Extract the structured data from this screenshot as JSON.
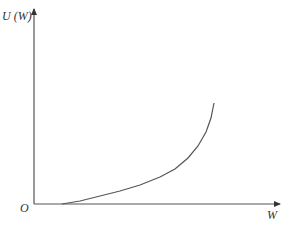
{
  "chart_data": {
    "type": "line",
    "title": "",
    "xlabel": "W",
    "ylabel": "U (W)",
    "origin_label": "O",
    "grid": false,
    "legend": null,
    "x_ticks": [],
    "y_ticks": [],
    "series": [
      {
        "name": "U(W)",
        "description": "Convex, increasing curve starting above origin on the W-axis and rising steeply toward the upper right",
        "points_px": [
          [
            62,
            204
          ],
          [
            80,
            201
          ],
          [
            100,
            196
          ],
          [
            120,
            191
          ],
          [
            140,
            185
          ],
          [
            160,
            177
          ],
          [
            175,
            169
          ],
          [
            188,
            158
          ],
          [
            198,
            146
          ],
          [
            206,
            132
          ],
          [
            211,
            118
          ],
          [
            214,
            103
          ]
        ]
      }
    ]
  },
  "colors": {
    "axis": "#444444",
    "curve": "#555555",
    "text": "#333333"
  }
}
